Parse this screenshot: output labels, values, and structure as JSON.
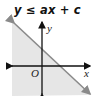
{
  "title": "y ≤ ax + c",
  "graph": {
    "x_axis_label": "x",
    "y_axis_label": "y",
    "origin_label": "O",
    "boundary": "solid",
    "shaded_side": "below",
    "shade_color": "#e6e6e6",
    "line_color": "#8a8a8a",
    "axis_color": "#111111"
  }
}
